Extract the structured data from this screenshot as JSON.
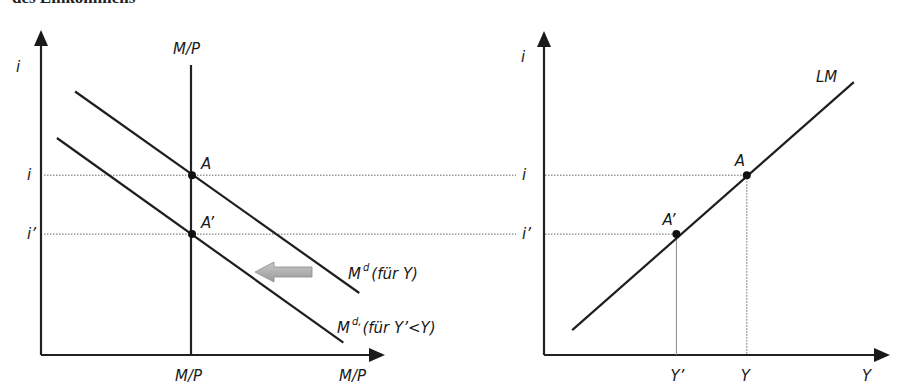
{
  "header": {
    "cut_off_text": "des Einkommens"
  },
  "colors": {
    "ink": "#1e1e1e",
    "shift_arrow": "#a8a8a8",
    "guide": "#666666"
  },
  "chart_data": [
    {
      "type": "line",
      "title": "Geldmarkt",
      "xlabel": "M/P",
      "ylabel": "i",
      "money_supply_label": "M/P",
      "money_supply_tick_label": "M/P",
      "series": [
        {
          "name": "M^d(für Y)",
          "label_base": "M",
          "label_sup": "d",
          "label_rest": "(für Y)",
          "kind": "downward",
          "points": [
            [
              0.15,
              0.85
            ],
            [
              1.4,
              0.2
            ]
          ]
        },
        {
          "name": "M^d'(für Y'<Y)",
          "label_base": "M",
          "label_sup": "d,",
          "label_rest": "(für Y’<Y)",
          "kind": "downward",
          "points": [
            [
              0.07,
              0.7
            ],
            [
              1.33,
              0.04
            ]
          ]
        }
      ],
      "points": [
        {
          "name": "A",
          "x": 0.6,
          "y": 0.58
        },
        {
          "name": "A’",
          "x": 0.6,
          "y": 0.39
        }
      ],
      "y_ticks": [
        {
          "label": "i",
          "value": 0.58
        },
        {
          "label": "i’",
          "value": 0.39
        }
      ],
      "shift_arrow": {
        "direction": "left",
        "meaning": "Nachfrage sinkt bei geringerem Einkommen"
      },
      "xlim": [
        0,
        1.5
      ],
      "ylim": [
        0,
        1
      ]
    },
    {
      "type": "line",
      "title": "LM-Kurve",
      "xlabel": "Y",
      "ylabel": "i",
      "series": [
        {
          "name": "LM",
          "points": [
            [
              0.1,
              0.08
            ],
            [
              1.1,
              0.88
            ]
          ]
        }
      ],
      "points": [
        {
          "name": "A",
          "x": 0.72,
          "y": 0.58
        },
        {
          "name": "A’",
          "x": 0.47,
          "y": 0.39
        }
      ],
      "y_ticks": [
        {
          "label": "i",
          "value": 0.58
        },
        {
          "label": "i’",
          "value": 0.39
        }
      ],
      "x_ticks": [
        {
          "label": "Y’",
          "value": 0.47
        },
        {
          "label": "Y",
          "value": 0.72
        }
      ],
      "xlim": [
        0,
        1.2
      ],
      "ylim": [
        0,
        1
      ]
    }
  ]
}
